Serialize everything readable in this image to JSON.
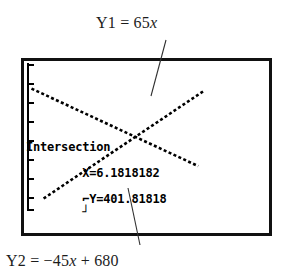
{
  "figure": {
    "type": "graphing-calculator-screenshot"
  },
  "annotations": {
    "top_label": {
      "name": "Y1",
      "equation_prefix": "Y1 = 65",
      "equation_var": "x",
      "full_text": "Y1 = 65x"
    },
    "bottom_label": {
      "name": "Y2",
      "equation_prefix": "Y2 = −45",
      "equation_var": "x",
      "equation_suffix": " + 680",
      "full_text": "Y2 = −45x + 680"
    }
  },
  "calculator": {
    "readout": {
      "status_label": "Intersection",
      "x_value": "X=6.1818182",
      "y_value": "Y=401.81818",
      "x_text": "X=6.1818182",
      "y_text": "⌐Y=401.81818",
      "trailing_marker": "┘"
    },
    "screen": {
      "border_color": "#111111",
      "background_color": "#ffffff",
      "pixel_color": "#000000"
    }
  },
  "chart_data": {
    "type": "line",
    "title": "",
    "xlabel": "",
    "ylabel": "",
    "grid": false,
    "legend": "external-annotations",
    "xlim": [
      0,
      11
    ],
    "ylim": [
      0,
      780
    ],
    "axis": {
      "y_axis_drawn_at_x": 0,
      "y_tick_count": 8,
      "y_tick_spacing": 100,
      "x_axis_visible": false
    },
    "series": [
      {
        "name": "Y1",
        "equation": "Y1 = 65x",
        "slope": 65,
        "intercept": 0,
        "style": "dotted",
        "x": [
          0.9,
          2,
          3,
          4,
          5,
          6.18,
          7,
          8,
          9,
          10.1
        ],
        "y": [
          58.5,
          130,
          195,
          260,
          325,
          401.8,
          455,
          520,
          585,
          656.5
        ]
      },
      {
        "name": "Y2",
        "equation": "Y2 = −45x + 680",
        "slope": -45,
        "intercept": 680,
        "style": "dotted",
        "x": [
          0.2,
          1,
          2,
          3,
          4,
          5,
          6.18,
          7,
          8,
          9,
          9.8
        ],
        "y": [
          671,
          635,
          590,
          545,
          500,
          455,
          401.8,
          365,
          320,
          275,
          239
        ]
      }
    ],
    "intersection": {
      "label": "Intersection",
      "x": 6.1818182,
      "y": 401.81818
    }
  }
}
